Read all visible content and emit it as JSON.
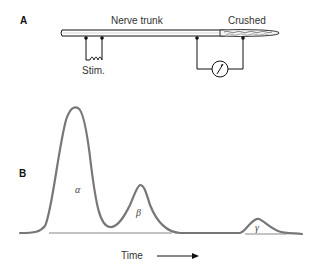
{
  "panel_a": {
    "label": "A",
    "nerve_label": "Nerve trunk",
    "crushed_label": "Crushed",
    "stim_label": "Stim."
  },
  "panel_b": {
    "label": "B",
    "peaks": [
      {
        "name": "alpha",
        "symbol": "α"
      },
      {
        "name": "beta",
        "symbol": "β"
      },
      {
        "name": "gamma",
        "symbol": "γ"
      }
    ],
    "x_axis_label": "Time"
  },
  "colors": {
    "line": "#111111",
    "trace": "#777777",
    "baseline": "#888888"
  }
}
